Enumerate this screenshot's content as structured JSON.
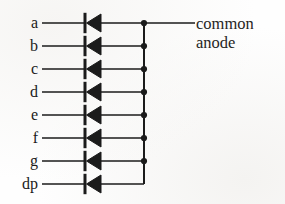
{
  "figure": {
    "background_color": "#fefefe",
    "ink_color": "#1b1b1b",
    "width": 285,
    "height": 204
  },
  "bus": {
    "label_line_1": "common",
    "label_line_2": "anode",
    "label_x": 196,
    "label_y_line_1": 14,
    "label_y_line_2": 33,
    "x": 144,
    "y_top": 23,
    "y_bottom": 184,
    "lead_end_x": 195,
    "lead_y": 23
  },
  "geometry": {
    "label_right_x": 38,
    "wire_start_x": 42,
    "diode_bar_x": 85,
    "diode_tip_x": 85,
    "diode_back_x": 101,
    "diode_half_height": 9,
    "row_spacing": 23,
    "wire_width": 1.6,
    "bus_width": 2.0,
    "dot_radius": 3.1
  },
  "rows": [
    {
      "label": "a",
      "y": 23,
      "junction": true,
      "name": "segment-a"
    },
    {
      "label": "b",
      "y": 46,
      "junction": true,
      "name": "segment-b"
    },
    {
      "label": "c",
      "y": 69,
      "junction": true,
      "name": "segment-c"
    },
    {
      "label": "d",
      "y": 92,
      "junction": true,
      "name": "segment-d"
    },
    {
      "label": "e",
      "y": 115,
      "junction": true,
      "name": "segment-e"
    },
    {
      "label": "f",
      "y": 138,
      "junction": true,
      "name": "segment-f"
    },
    {
      "label": "g",
      "y": 161,
      "junction": true,
      "name": "segment-g"
    },
    {
      "label": "dp",
      "y": 184,
      "junction": false,
      "name": "decimal-point"
    }
  ],
  "icons": {
    "diode": "diode-icon",
    "junction": "junction-dot-icon"
  }
}
